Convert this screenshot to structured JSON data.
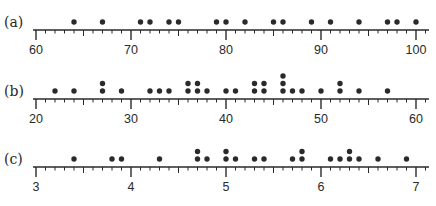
{
  "colors": {
    "ink": "#2a2a2a",
    "background": "#ffffff"
  },
  "chart_data": [
    {
      "type": "scatter",
      "subtype": "dot_plot",
      "panel_label": "(a)",
      "xlim": [
        60,
        101
      ],
      "major_ticks": [
        60,
        70,
        80,
        90,
        100
      ],
      "minor_step": 1,
      "tick_labels": [
        "60",
        "70",
        "80",
        "90",
        "100"
      ],
      "values": [
        64,
        67,
        71,
        72,
        74,
        75,
        79,
        80,
        82,
        85,
        86,
        89,
        91,
        94,
        97,
        98,
        100
      ]
    },
    {
      "type": "scatter",
      "subtype": "dot_plot",
      "panel_label": "(b)",
      "xlim": [
        20,
        61
      ],
      "major_ticks": [
        20,
        30,
        40,
        50,
        60
      ],
      "minor_step": 1,
      "tick_labels": [
        "20",
        "30",
        "40",
        "50",
        "60"
      ],
      "values": [
        22,
        24,
        27,
        27,
        29,
        32,
        33,
        34,
        36,
        36,
        37,
        37,
        38,
        40,
        41,
        43,
        43,
        44,
        44,
        46,
        46,
        46,
        47,
        48,
        50,
        52,
        52,
        54,
        57
      ]
    },
    {
      "type": "scatter",
      "subtype": "dot_plot",
      "panel_label": "(c)",
      "xlim": [
        3,
        7.1
      ],
      "major_ticks": [
        3,
        4,
        5,
        6,
        7
      ],
      "minor_step": 0.1,
      "tick_labels": [
        "3",
        "4",
        "5",
        "6",
        "7"
      ],
      "values": [
        3.4,
        3.8,
        3.9,
        4.3,
        4.7,
        4.7,
        4.8,
        5.0,
        5.0,
        5.1,
        5.3,
        5.4,
        5.7,
        5.8,
        5.8,
        6.1,
        6.2,
        6.3,
        6.3,
        6.4,
        6.6,
        6.9
      ]
    }
  ]
}
